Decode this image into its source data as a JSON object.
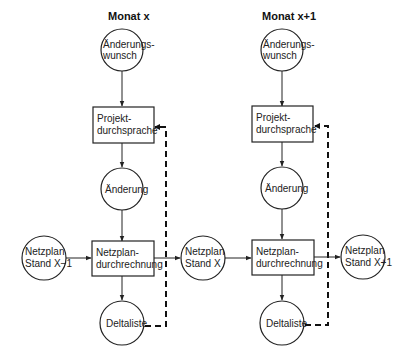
{
  "columns": [
    {
      "title": "Monat x",
      "change_request": [
        "Änderungs-",
        "wunsch"
      ],
      "project_review": [
        "Projekt-",
        "durchsprache"
      ],
      "change": "Änderung",
      "network_calc": [
        "Netzplan-",
        "durchrechnung"
      ],
      "delta_list": "Deltaliste"
    },
    {
      "title": "Monat x+1",
      "change_request": [
        "Änderungs-",
        "wunsch"
      ],
      "project_review": [
        "Projekt-",
        "durchsprache"
      ],
      "change": "Änderung",
      "network_calc": [
        "Netzplan-",
        "durchrechnung"
      ],
      "delta_list": "Deltaliste"
    }
  ],
  "network_states": [
    [
      "Netzplan",
      "Stand X−1"
    ],
    [
      "Netzplan",
      "Stand X"
    ],
    [
      "Netzplan",
      "Stand X+1"
    ]
  ]
}
